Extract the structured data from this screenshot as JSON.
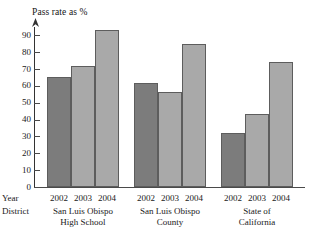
{
  "chart_data": {
    "type": "bar",
    "title": "Pass rate as %",
    "xlabel": "",
    "ylabel": "Pass rate as %",
    "ylim": [
      0,
      95
    ],
    "yticks": [
      0,
      10,
      20,
      30,
      40,
      50,
      60,
      70,
      80,
      90
    ],
    "grid": false,
    "legend": "none",
    "row_headers": {
      "year": "Year",
      "district": "District"
    },
    "categories": [
      "2002",
      "2003",
      "2004"
    ],
    "groups": [
      {
        "district_line1": "San Luis Obispo",
        "district_line2": "High School",
        "bars": [
          {
            "year": "2002",
            "value": 65.5,
            "color": "#7c7c7c"
          },
          {
            "year": "2003",
            "value": 72,
            "color": "#a9a9a9"
          },
          {
            "year": "2004",
            "value": 93,
            "color": "#a9a9a9"
          }
        ]
      },
      {
        "district_line1": "San Luis Obispo",
        "district_line2": "County",
        "bars": [
          {
            "year": "2002",
            "value": 62,
            "color": "#7c7c7c"
          },
          {
            "year": "2003",
            "value": 56.5,
            "color": "#a9a9a9"
          },
          {
            "year": "2004",
            "value": 85,
            "color": "#a9a9a9"
          }
        ]
      },
      {
        "district_line1": "State of",
        "district_line2": "California",
        "bars": [
          {
            "year": "2002",
            "value": 32,
            "color": "#7c7c7c"
          },
          {
            "year": "2003",
            "value": 43.5,
            "color": "#a9a9a9"
          },
          {
            "year": "2004",
            "value": 74,
            "color": "#a9a9a9"
          }
        ]
      }
    ],
    "colors": {
      "bar_2002": "#7c7c7c",
      "bar_other": "#a9a9a9",
      "bar_border": "#5d5d5d",
      "axis": "#4a4a4a",
      "text": "#1a1a1a",
      "background": "#ffffff"
    }
  }
}
